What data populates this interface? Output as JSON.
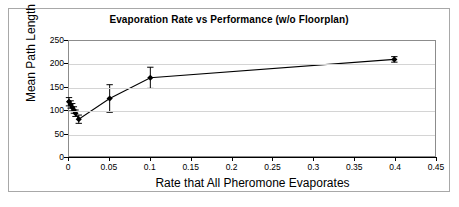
{
  "chart_data": {
    "type": "scatter",
    "title": "Evaporation Rate vs Performance (w/o Floorplan)",
    "xlabel": "Rate that All Pheromone Evaporates",
    "ylabel": "Mean Path Length",
    "xlim": [
      0,
      0.45
    ],
    "ylim": [
      0,
      250
    ],
    "xticks": [
      "0",
      "0.05",
      "0.1",
      "0.15",
      "0.2",
      "0.25",
      "0.3",
      "0.35",
      "0.4",
      "0.45"
    ],
    "xtick_values": [
      0,
      0.05,
      0.1,
      0.15,
      0.2,
      0.25,
      0.3,
      0.35,
      0.4,
      0.45
    ],
    "yticks": [
      "0",
      "50",
      "100",
      "150",
      "200",
      "250"
    ],
    "ytick_values": [
      0,
      50,
      100,
      150,
      200,
      250
    ],
    "grid": "horizontal",
    "legend": "none",
    "marker": "diamond",
    "line_style": "solid",
    "error_bars": "vertical",
    "series": [
      {
        "name": "Mean Path Length",
        "x": [
          0.0,
          0.002,
          0.004,
          0.006,
          0.008,
          0.012,
          0.05,
          0.1,
          0.4
        ],
        "values": [
          118,
          112,
          106,
          100,
          93,
          80,
          125,
          170,
          210
        ],
        "err": [
          9,
          8,
          8,
          7,
          7,
          9,
          30,
          23,
          6
        ]
      }
    ]
  }
}
